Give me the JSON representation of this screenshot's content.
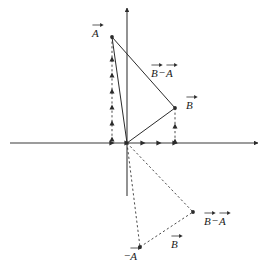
{
  "figure": {
    "kind": "vector-subtraction-geometry",
    "width": 268,
    "height": 273,
    "background_color": "#ffffff",
    "ink_color": "#2b2b2b",
    "axis_color": "#3a3a3a"
  },
  "axes": {
    "origin": {
      "x": 127,
      "y": 143
    },
    "x_axis": {
      "x1": 10,
      "y1": 143,
      "x2": 258,
      "y2": 143,
      "arrow_end": "right"
    },
    "y_axis": {
      "x1": 127,
      "y1": 196,
      "x2": 127,
      "y2": 8,
      "arrow_end": "up"
    },
    "x_ticks": [
      {
        "x": 112,
        "y": 143
      },
      {
        "x": 127,
        "y": 143
      },
      {
        "x": 143,
        "y": 143
      },
      {
        "x": 159,
        "y": 143
      },
      {
        "x": 175,
        "y": 143
      }
    ]
  },
  "points": {
    "A_tip": {
      "x": 112,
      "y": 37
    },
    "B_tip": {
      "x": 175,
      "y": 108
    },
    "neg_A_tip": {
      "x": 140,
      "y": 247
    },
    "B_minus_A_tip": {
      "x": 193,
      "y": 212
    }
  },
  "segments": {
    "solid": [
      {
        "name": "vector-a-shaft",
        "x1": 127,
        "y1": 143,
        "x2": 112,
        "y2": 37
      },
      {
        "name": "vector-b-shaft",
        "x1": 127,
        "y1": 143,
        "x2": 175,
        "y2": 108
      },
      {
        "name": "vector-b-minus-a-shaft",
        "x1": 112,
        "y1": 37,
        "x2": 175,
        "y2": 108
      }
    ],
    "dashed": [
      {
        "name": "neg-a-shaft",
        "x1": 127,
        "y1": 143,
        "x2": 140,
        "y2": 247
      },
      {
        "name": "b-minus-a-dashed-shaft",
        "x1": 127,
        "y1": 143,
        "x2": 193,
        "y2": 212
      },
      {
        "name": "b-dashed-shaft",
        "x1": 140,
        "y1": 247,
        "x2": 193,
        "y2": 212
      },
      {
        "name": "a-component-guide",
        "x1": 112,
        "y1": 37,
        "x2": 112,
        "y2": 143
      },
      {
        "name": "b-component-guide",
        "x1": 175,
        "y1": 108,
        "x2": 175,
        "y2": 143
      }
    ]
  },
  "guide_ticks": {
    "a_column_x": 112,
    "a_column_marks": [
      59,
      75,
      91,
      107,
      123,
      139
    ],
    "b_column_x": 175,
    "b_column_marks": [
      126,
      141
    ]
  },
  "labels": [
    {
      "id": "label-a-upper",
      "text": "A",
      "leading_minus": false,
      "terms": [
        "A"
      ],
      "x": 92,
      "y": 22
    },
    {
      "id": "label-b-minus-a-upper",
      "text": "B − A",
      "leading_minus": false,
      "terms": [
        "B",
        "A"
      ],
      "operator": "−",
      "x": 151,
      "y": 62
    },
    {
      "id": "label-b-upper",
      "text": "B",
      "leading_minus": false,
      "terms": [
        "B"
      ],
      "x": 186,
      "y": 94
    },
    {
      "id": "label-neg-a-lower",
      "text": "−A",
      "leading_minus": true,
      "terms": [
        "A"
      ],
      "x": 124,
      "y": 245
    },
    {
      "id": "label-b-lower",
      "text": "B",
      "leading_minus": false,
      "terms": [
        "B"
      ],
      "x": 171,
      "y": 233
    },
    {
      "id": "label-b-minus-a-lower",
      "text": "B − A",
      "leading_minus": false,
      "terms": [
        "B",
        "A"
      ],
      "operator": "−",
      "x": 204,
      "y": 210
    }
  ],
  "text": {
    "symbol_a": "A",
    "symbol_b": "B",
    "operator_minus": "−",
    "sign_negative": "−"
  }
}
